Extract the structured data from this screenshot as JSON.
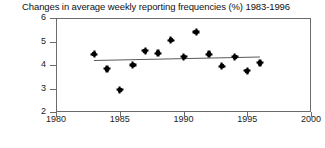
{
  "chart_data": {
    "type": "scatter",
    "title": "Changes in average weekly reporting frequencies (%) 1983-1996",
    "xlabel": "",
    "ylabel": "",
    "xlim": [
      1980,
      2000
    ],
    "ylim": [
      2,
      6
    ],
    "xticks": [
      1980,
      1985,
      1990,
      1995,
      2000
    ],
    "yticks": [
      2,
      3,
      4,
      5,
      6
    ],
    "grid": false,
    "legend": false,
    "marker": "filled-circle",
    "marker_color": "#000000",
    "x": [
      1983,
      1984,
      1985,
      1986,
      1987,
      1988,
      1989,
      1990,
      1991,
      1992,
      1993,
      1994,
      1995,
      1996
    ],
    "values": [
      4.45,
      3.85,
      2.95,
      4.0,
      4.6,
      4.5,
      5.05,
      4.35,
      5.4,
      4.45,
      3.95,
      4.35,
      3.75,
      4.1
    ],
    "trendline": {
      "type": "linear-fit",
      "x_start": 1983,
      "x_end": 1996,
      "y_start": 4.22,
      "y_end": 4.37,
      "color": "#5a5a5a"
    }
  }
}
